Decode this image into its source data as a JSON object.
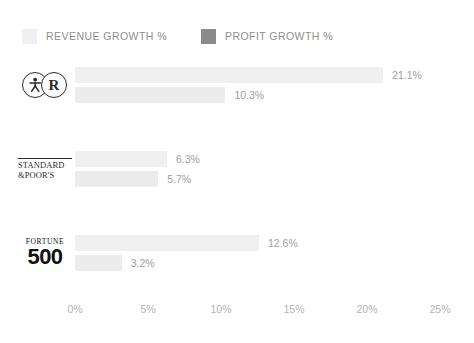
{
  "legend": {
    "entries": [
      {
        "label": "REVENUE GROWTH %",
        "color": "#f0f0f0",
        "key": "revenue"
      },
      {
        "label": "PROFIT GROWTH %",
        "color": "#8a8a8a",
        "key": "profit"
      }
    ]
  },
  "axis": {
    "ticks": [
      "0%",
      "5%",
      "10%",
      "15%",
      "20%",
      "25%"
    ],
    "min": 0,
    "max": 25
  },
  "groups": [
    {
      "logo_type": "rings",
      "logo_name": "running-figure-r-logo",
      "logo_letter": "R",
      "revenue": {
        "value": 21.1,
        "label": "21.1%"
      },
      "profit": {
        "value": 10.3,
        "label": "10.3%"
      }
    },
    {
      "logo_type": "standard-poors",
      "logo_name": "standard-poors-logo",
      "logo_line1": "STANDARD",
      "logo_line2": "&POOR'S",
      "revenue": {
        "value": 6.3,
        "label": "6.3%"
      },
      "profit": {
        "value": 5.7,
        "label": "5.7%"
      }
    },
    {
      "logo_type": "fortune",
      "logo_name": "fortune-500-logo",
      "logo_word": "FORTUNE",
      "logo_number": "500",
      "revenue": {
        "value": 12.6,
        "label": "12.6%"
      },
      "profit": {
        "value": 3.2,
        "label": "3.2%"
      }
    }
  ],
  "chart_data": {
    "type": "bar",
    "orientation": "horizontal",
    "title": "",
    "xlabel": "",
    "ylabel": "",
    "categories": [
      "Running-figure R index",
      "Standard & Poor's",
      "Fortune 500"
    ],
    "series": [
      {
        "name": "REVENUE GROWTH %",
        "color": "#f0f0f0",
        "values": [
          21.1,
          6.3,
          12.6
        ]
      },
      {
        "name": "PROFIT GROWTH %",
        "color": "#ececec",
        "legend_color": "#8a8a8a",
        "values": [
          10.3,
          5.7,
          3.2
        ]
      }
    ],
    "xlim": [
      0,
      25
    ],
    "xticks": [
      0,
      5,
      10,
      15,
      20,
      25
    ],
    "xtick_labels": [
      "0%",
      "5%",
      "10%",
      "15%",
      "20%",
      "25%"
    ],
    "grid": false,
    "legend_position": "top-left",
    "data_labels": true
  }
}
